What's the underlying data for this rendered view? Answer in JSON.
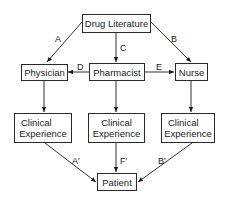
{
  "diagram": {
    "nodes": {
      "drug_literature": {
        "label": "Drug Literature"
      },
      "physician": {
        "label": "Physician"
      },
      "pharmacist": {
        "label": "Pharmacist"
      },
      "nurse": {
        "label": "Nurse"
      },
      "clinical_left": {
        "line1": "Clinical",
        "line2": "Experience"
      },
      "clinical_center": {
        "line1": "Clinical",
        "line2": "Experience"
      },
      "clinical_right": {
        "line1": "Clinical",
        "line2": "Experience"
      },
      "patient": {
        "label": "Patient"
      }
    },
    "edges": [
      {
        "from": "Drug Literature",
        "to": "Physician",
        "label": "A"
      },
      {
        "from": "Drug Literature",
        "to": "Nurse",
        "label": "B"
      },
      {
        "from": "Drug Literature",
        "to": "Pharmacist",
        "label": "C"
      },
      {
        "from": "Pharmacist",
        "to": "Physician",
        "label": "D"
      },
      {
        "from": "Pharmacist",
        "to": "Nurse",
        "label": "E"
      },
      {
        "from": "Physician",
        "to": "Clinical Experience (left)",
        "label": ""
      },
      {
        "from": "Pharmacist",
        "to": "Clinical Experience (center)",
        "label": ""
      },
      {
        "from": "Nurse",
        "to": "Clinical Experience (right)",
        "label": ""
      },
      {
        "from": "Clinical Experience (left)",
        "to": "Patient",
        "label": "A′"
      },
      {
        "from": "Clinical Experience (center)",
        "to": "Patient",
        "label": "F′"
      },
      {
        "from": "Clinical Experience (right)",
        "to": "Patient",
        "label": "B′"
      }
    ],
    "labels": {
      "A": "A",
      "B": "B",
      "C": "C",
      "D": "D",
      "E": "E",
      "A_prime": "A′",
      "F_prime": "F′",
      "B_prime": "B′"
    }
  }
}
